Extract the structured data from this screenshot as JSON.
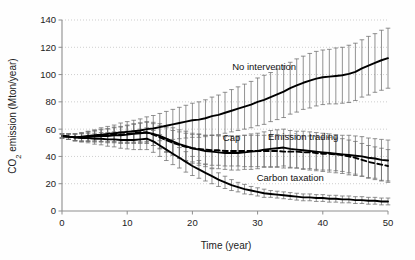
{
  "chart_data": {
    "type": "line",
    "title": "",
    "xlabel": "Time (year)",
    "ylabel": "CO2 emission (Mton/year)",
    "ylabel_display": "CO₂ emission (Mton/year)",
    "xlim": [
      0,
      50
    ],
    "ylim": [
      0,
      140
    ],
    "xticks": [
      0,
      10,
      20,
      30,
      40,
      50
    ],
    "yticks": [
      0,
      20,
      40,
      60,
      80,
      100,
      120,
      140
    ],
    "grid": true,
    "grid_axis": "y",
    "legend": "inline-annotations",
    "error_bars": true,
    "x": [
      0,
      1,
      2,
      3,
      4,
      5,
      6,
      7,
      8,
      9,
      10,
      11,
      12,
      13,
      14,
      15,
      16,
      17,
      18,
      19,
      20,
      21,
      22,
      23,
      24,
      25,
      26,
      27,
      28,
      29,
      30,
      31,
      32,
      33,
      34,
      35,
      36,
      37,
      38,
      39,
      40,
      41,
      42,
      43,
      44,
      45,
      46,
      47,
      48,
      49,
      50
    ],
    "series": [
      {
        "name": "No intervention",
        "style": "solid",
        "label_x": 31,
        "label_y": 103,
        "values": [
          55,
          54.5,
          54,
          54.5,
          55,
          55.5,
          56,
          56.5,
          57,
          57.5,
          58,
          58.5,
          59,
          60,
          60.5,
          61.5,
          62.5,
          63.5,
          64.5,
          65.5,
          66.5,
          67,
          68,
          69.5,
          70.5,
          72,
          73.5,
          75,
          76.5,
          78,
          80,
          81.5,
          83.5,
          85.5,
          87.5,
          90,
          92,
          94,
          95.5,
          97,
          98,
          98.5,
          99,
          99.5,
          100.5,
          102,
          104.5,
          106.5,
          108.5,
          110.5,
          112
        ],
        "errors": [
          1.5,
          2,
          2.5,
          3,
          3.5,
          4,
          5,
          5.5,
          6,
          7,
          7.5,
          8,
          8.5,
          9,
          9.5,
          10,
          10.5,
          11,
          11.5,
          12,
          12.5,
          13,
          13.5,
          14,
          14.5,
          15,
          15.5,
          16,
          16.5,
          17,
          17.5,
          18,
          18,
          18.5,
          19,
          19,
          19.5,
          19.5,
          20,
          20,
          20,
          20,
          20.5,
          20.5,
          21,
          21,
          21,
          21.5,
          21.5,
          22,
          22
        ]
      },
      {
        "name": "Emission trading",
        "style": "solid",
        "label_x": 37,
        "label_y": 52,
        "values": [
          55,
          54.5,
          54,
          54,
          54.5,
          54.5,
          55,
          55,
          55.5,
          55.5,
          56,
          56.5,
          57,
          57.5,
          56.5,
          55,
          53,
          51,
          49,
          47.5,
          46,
          45,
          44,
          43.5,
          43,
          42.5,
          42.5,
          42.5,
          43,
          43.5,
          44,
          45,
          45.5,
          46,
          46.5,
          45.5,
          45,
          44.5,
          44,
          43.5,
          43,
          42.5,
          42,
          41.5,
          41,
          40.5,
          40,
          39,
          38.5,
          37.5,
          37
        ],
        "errors": [
          1.5,
          2,
          2.5,
          3,
          3.5,
          4,
          4.5,
          5,
          5.5,
          6,
          6.5,
          7,
          7.5,
          8,
          8.5,
          9,
          9.5,
          10,
          10.5,
          11,
          11,
          11.5,
          11.5,
          12,
          12,
          12,
          12.5,
          12.5,
          12.5,
          13,
          13,
          13,
          13.5,
          13.5,
          13.5,
          13.5,
          13.5,
          14,
          14,
          14,
          14,
          14,
          14,
          14,
          14.5,
          14.5,
          14.5,
          14.5,
          14.5,
          15,
          15
        ]
      },
      {
        "name": "Cap",
        "style": "dashed",
        "label_x": 26,
        "label_y": 51,
        "values": [
          55,
          54.5,
          54,
          54,
          54.5,
          55,
          55.5,
          55.5,
          56,
          56,
          56.5,
          57,
          57.5,
          57.5,
          56,
          54,
          52,
          50,
          48.5,
          47,
          46,
          45.5,
          45,
          44.5,
          44.5,
          44,
          44,
          44,
          44,
          44,
          44,
          44,
          44,
          44,
          43.5,
          43.5,
          43.5,
          43,
          43,
          42.5,
          42,
          42,
          41.5,
          41,
          40,
          39,
          37.5,
          36,
          35,
          34,
          33
        ],
        "errors": [
          1.5,
          2,
          2.5,
          3,
          3.5,
          4,
          4.5,
          5,
          5.5,
          6,
          6.5,
          7,
          7,
          7.5,
          8,
          8.5,
          9,
          9,
          9.5,
          10,
          10,
          10.5,
          10.5,
          11,
          11,
          11,
          11,
          11,
          11.5,
          11.5,
          11.5,
          11.5,
          11.5,
          12,
          12,
          12,
          12,
          12,
          12,
          12,
          12,
          12,
          12,
          12,
          12,
          12,
          12,
          12,
          12,
          12,
          12
        ]
      },
      {
        "name": "Carbon taxation",
        "style": "solid",
        "label_x": 35,
        "label_y": 22,
        "values": [
          55,
          54.5,
          54,
          53.5,
          53.5,
          53,
          53,
          52.5,
          52.5,
          52,
          52,
          52,
          52.5,
          53,
          51,
          48,
          45,
          42,
          39,
          36,
          33,
          30.5,
          28,
          25.5,
          23,
          21,
          19,
          17.5,
          16,
          15,
          14,
          13,
          12.5,
          12,
          11.5,
          11,
          10.5,
          10,
          10,
          9.5,
          9.5,
          9,
          9,
          8.5,
          8.5,
          8,
          8,
          7.5,
          7.5,
          7,
          7
        ],
        "errors": [
          1.5,
          2,
          2.5,
          3,
          3.5,
          4,
          4.5,
          5,
          5.5,
          6,
          6.5,
          7,
          7.5,
          8,
          8,
          8,
          8,
          8,
          7.5,
          7.5,
          7,
          6.5,
          6,
          5.5,
          5,
          4.5,
          4,
          3.5,
          3.5,
          3,
          3,
          3,
          2.5,
          2.5,
          2.5,
          2.5,
          2.5,
          2.5,
          2.5,
          2.5,
          2.5,
          2.5,
          2.5,
          2.5,
          2.5,
          2.5,
          2.5,
          2.5,
          2.5,
          2.5,
          2.5
        ]
      }
    ]
  }
}
